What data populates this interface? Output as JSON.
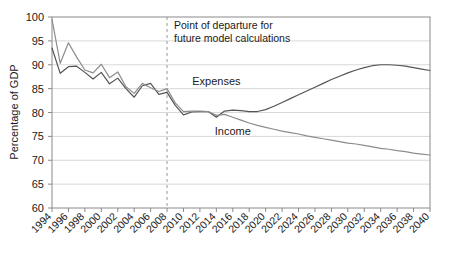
{
  "chart_data": {
    "type": "line",
    "title": "",
    "xlabel": "",
    "ylabel": "Percentage of GDP",
    "ylim": [
      60,
      100
    ],
    "ytick_step": 5,
    "yticks": [
      60,
      65,
      70,
      75,
      80,
      85,
      90,
      95,
      100
    ],
    "xlim": [
      1994,
      2040
    ],
    "grid": true,
    "grid_axis": "y",
    "legend": "inline-labels",
    "categories": [
      1994,
      1995,
      1996,
      1997,
      1998,
      1999,
      2000,
      2001,
      2002,
      2003,
      2004,
      2005,
      2006,
      2007,
      2008,
      2009,
      2010,
      2011,
      2012,
      2013,
      2014,
      2015,
      2016,
      2017,
      2018,
      2019,
      2020,
      2021,
      2022,
      2023,
      2024,
      2025,
      2026,
      2027,
      2028,
      2029,
      2030,
      2031,
      2032,
      2033,
      2034,
      2035,
      2036,
      2037,
      2038,
      2039,
      2040
    ],
    "xticks": [
      1994,
      1996,
      1998,
      2000,
      2002,
      2004,
      2006,
      2008,
      2010,
      2012,
      2014,
      2016,
      2018,
      2020,
      2022,
      2024,
      2026,
      2028,
      2030,
      2032,
      2034,
      2036,
      2038,
      2040
    ],
    "series": [
      {
        "name": "Expenses",
        "color": "#555555",
        "label_x": 2014,
        "label_y": 85.8,
        "values": [
          93.5,
          88.2,
          89.6,
          89.7,
          88.4,
          87.0,
          88.4,
          86.0,
          87.2,
          85.0,
          83.2,
          85.6,
          86.1,
          83.8,
          84.2,
          81.5,
          79.5,
          80.1,
          80.2,
          80.2,
          79.0,
          80.3,
          80.5,
          80.4,
          80.2,
          80.2,
          80.6,
          81.3,
          82.1,
          82.9,
          83.7,
          84.5,
          85.3,
          86.1,
          86.9,
          87.6,
          88.3,
          88.9,
          89.4,
          89.8,
          90.0,
          90.0,
          89.9,
          89.7,
          89.4,
          89.1,
          88.8
        ]
      },
      {
        "name": "Income",
        "color": "#8c8c8c",
        "label_x": 2016,
        "label_y": 75.2,
        "values": [
          99.5,
          90.3,
          94.6,
          91.6,
          88.9,
          88.3,
          90.1,
          87.3,
          88.5,
          85.4,
          84.0,
          86.1,
          85.2,
          84.4,
          85.0,
          82.0,
          80.2,
          80.3,
          80.3,
          80.2,
          79.4,
          79.6,
          79.0,
          78.4,
          77.8,
          77.3,
          76.9,
          76.5,
          76.1,
          75.8,
          75.5,
          75.1,
          74.8,
          74.5,
          74.2,
          73.9,
          73.6,
          73.4,
          73.1,
          72.8,
          72.5,
          72.3,
          72.0,
          71.8,
          71.5,
          71.3,
          71.1
        ]
      }
    ],
    "annotations": [
      {
        "name": "point-of-departure",
        "lines": [
          "Point of departure for",
          "future model calculations"
        ],
        "x": 2008,
        "marker": "dashed-vertical-line",
        "marker_color": "#999999"
      }
    ]
  }
}
